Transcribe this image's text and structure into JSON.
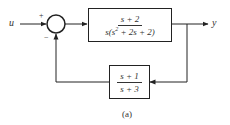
{
  "diagram": {
    "type": "feedback-block-diagram",
    "caption": "(a)",
    "input": {
      "label": "u"
    },
    "output": {
      "label": "y"
    },
    "summing_junction": {
      "plus_sign": "+",
      "minus_sign": "−"
    },
    "forward_block": {
      "numerator": "s + 2",
      "denominator_prefix": "s(s",
      "denominator_exp": "2",
      "denominator_suffix": " + 2s + 2)"
    },
    "feedback_block": {
      "numerator": "s + 1",
      "denominator": "s + 3"
    },
    "colors": {
      "line": "#222222",
      "text": "#333333",
      "background": "#ffffff"
    }
  }
}
